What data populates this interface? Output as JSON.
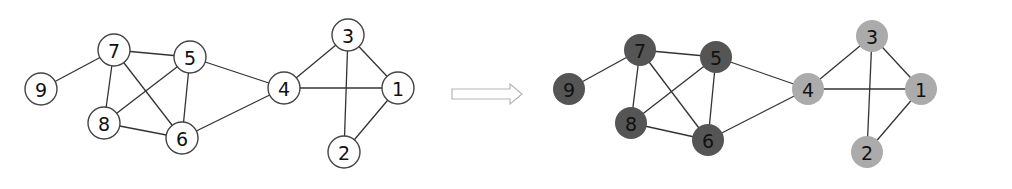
{
  "diagram": {
    "type": "graph-community-coloring",
    "node_radius": 16,
    "colors": {
      "plain_fill": "#ffffff",
      "plain_stroke": "#444444",
      "community_a": "#555555",
      "community_b": "#ababab",
      "arrow_stroke": "#b5b5b5"
    },
    "edges": [
      [
        9,
        7
      ],
      [
        7,
        5
      ],
      [
        7,
        8
      ],
      [
        7,
        6
      ],
      [
        5,
        8
      ],
      [
        5,
        6
      ],
      [
        8,
        6
      ],
      [
        5,
        4
      ],
      [
        6,
        4
      ],
      [
        4,
        3
      ],
      [
        4,
        1
      ],
      [
        3,
        1
      ],
      [
        3,
        2
      ],
      [
        1,
        2
      ]
    ],
    "left_graph": {
      "nodes": [
        {
          "id": "9",
          "label": "9",
          "x": 41,
          "y": 89
        },
        {
          "id": "7",
          "label": "7",
          "x": 114,
          "y": 50
        },
        {
          "id": "5",
          "label": "5",
          "x": 190,
          "y": 57
        },
        {
          "id": "8",
          "label": "8",
          "x": 104,
          "y": 123
        },
        {
          "id": "6",
          "label": "6",
          "x": 182,
          "y": 138
        },
        {
          "id": "4",
          "label": "4",
          "x": 284,
          "y": 88
        },
        {
          "id": "3",
          "label": "3",
          "x": 348,
          "y": 35
        },
        {
          "id": "1",
          "label": "1",
          "x": 398,
          "y": 88
        },
        {
          "id": "2",
          "label": "2",
          "x": 344,
          "y": 152
        }
      ]
    },
    "arrow": {
      "x1": 452,
      "x2": 522,
      "y": 94
    },
    "right_graph": {
      "nodes": [
        {
          "id": "9",
          "label": "9",
          "x": 569,
          "y": 89,
          "community": "a"
        },
        {
          "id": "7",
          "label": "7",
          "x": 640,
          "y": 50,
          "community": "a"
        },
        {
          "id": "5",
          "label": "5",
          "x": 716,
          "y": 57,
          "community": "a"
        },
        {
          "id": "8",
          "label": "8",
          "x": 631,
          "y": 123,
          "community": "a"
        },
        {
          "id": "6",
          "label": "6",
          "x": 708,
          "y": 140,
          "community": "a"
        },
        {
          "id": "4",
          "label": "4",
          "x": 808,
          "y": 89,
          "community": "b"
        },
        {
          "id": "3",
          "label": "3",
          "x": 872,
          "y": 36,
          "community": "b"
        },
        {
          "id": "1",
          "label": "1",
          "x": 921,
          "y": 89,
          "community": "b"
        },
        {
          "id": "2",
          "label": "2",
          "x": 867,
          "y": 152,
          "community": "b"
        }
      ]
    }
  }
}
